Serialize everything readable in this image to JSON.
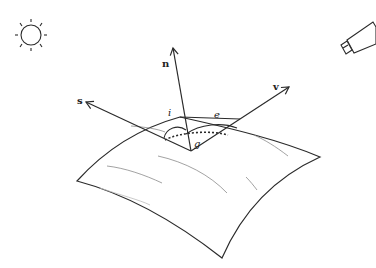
{
  "diagram": {
    "type": "reflectance-geometry",
    "icons": {
      "light_source": "sun-icon",
      "viewer": "camera-icon"
    },
    "vectors": [
      {
        "id": "s",
        "label": "s",
        "meaning": "source direction"
      },
      {
        "id": "n",
        "label": "n",
        "meaning": "surface normal"
      },
      {
        "id": "v",
        "label": "v",
        "meaning": "viewing direction"
      }
    ],
    "angles": [
      {
        "id": "i",
        "label": "i",
        "between": [
          "s",
          "n"
        ]
      },
      {
        "id": "e",
        "label": "e",
        "between": [
          "n",
          "v"
        ]
      },
      {
        "id": "g",
        "label": "g",
        "between": [
          "s",
          "v"
        ],
        "style": "dotted"
      }
    ],
    "colors": {
      "stroke": "#2a2a2a",
      "texture": "#8a8a8a",
      "background": "#ffffff"
    }
  }
}
